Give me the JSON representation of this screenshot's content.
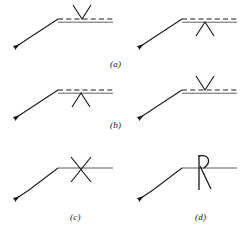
{
  "figure": {
    "title": "",
    "width": 246,
    "height": 241,
    "background_color": "#ffffff",
    "stroke_color": "#1a1a1a",
    "panel_count": 4
  },
  "panels": [
    {
      "id": "a",
      "label": "(a)",
      "position": "top-left",
      "line_type": "dashed-over-solid",
      "symbol": "v-caret-down",
      "symbol_name": "downward-caret-above-line",
      "arrow_direction": "down-left"
    },
    {
      "id": "a2",
      "label": "",
      "position": "top-right",
      "line_type": "dashed-over-solid",
      "symbol": "v-caret-up",
      "symbol_name": "upward-caret-below-line",
      "arrow_direction": "down-left"
    },
    {
      "id": "b",
      "label": "(b)",
      "position": "middle-left",
      "line_type": "dashed-over-solid",
      "symbol": "v-caret-up",
      "symbol_name": "upward-caret-below-line",
      "arrow_direction": "down-left"
    },
    {
      "id": "b2",
      "label": "",
      "position": "middle-right",
      "line_type": "dashed-over-solid",
      "symbol": "v-caret-down",
      "symbol_name": "downward-caret-above-line",
      "arrow_direction": "down-left"
    },
    {
      "id": "c",
      "label": "(c)",
      "position": "bottom-left",
      "line_type": "solid",
      "symbol": "x-cross",
      "symbol_name": "x-cross-on-line",
      "arrow_direction": "down-left"
    },
    {
      "id": "d",
      "label": "(d)",
      "position": "bottom-right",
      "line_type": "solid",
      "symbol": "k-hook",
      "symbol_name": "vertical-bar-with-hook-and-diagonal",
      "arrow_direction": "down-left"
    }
  ],
  "labels": {
    "a": "(a)",
    "b": "(b)",
    "c": "(c)",
    "d": "(d)"
  }
}
